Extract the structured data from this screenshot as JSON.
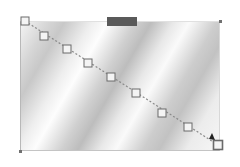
{
  "editor": {
    "frame": {
      "x": 20,
      "y": 21,
      "width": 200,
      "height": 130
    },
    "tab": {
      "color": "#5a5a5a"
    },
    "gradient_line": {
      "start": [
        25,
        21
      ],
      "end": [
        218,
        145
      ],
      "line_color": "#8a8a8a",
      "nodes": [
        [
          25,
          21
        ],
        [
          44,
          36
        ],
        [
          67,
          49
        ],
        [
          88,
          63
        ],
        [
          111,
          77
        ],
        [
          136,
          93
        ],
        [
          162,
          113
        ],
        [
          188,
          127
        ],
        [
          218,
          145
        ]
      ],
      "node_stroke": "#6a6a6a",
      "end_arrow_color": "#222222"
    },
    "corner_handles": [
      [
        220,
        21
      ],
      [
        20,
        151
      ]
    ]
  }
}
